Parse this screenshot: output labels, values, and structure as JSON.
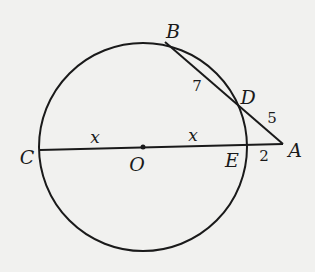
{
  "diagram": {
    "type": "geometry",
    "colors": {
      "background": "#f1f1ef",
      "stroke": "#1a1a1a"
    },
    "points": {
      "A": {
        "label": "A",
        "x": 283,
        "y": 144
      },
      "B": {
        "label": "B",
        "x": 165,
        "y": 42
      },
      "C": {
        "label": "C",
        "x": 40,
        "y": 150
      },
      "D": {
        "label": "D",
        "x": 238,
        "y": 104
      },
      "E": {
        "label": "E",
        "x": 247,
        "y": 146
      },
      "O": {
        "label": "O",
        "x": 143,
        "y": 147
      }
    },
    "circle": {
      "center": "O",
      "cx": 143,
      "cy": 147,
      "r": 104
    },
    "segments": [
      {
        "from": "C",
        "to": "A",
        "note": "diameter CE extended to A"
      },
      {
        "from": "B",
        "to": "A",
        "note": "secant through D"
      }
    ],
    "measures": {
      "BD": "7",
      "DA": "5",
      "EA": "2",
      "CO": "x",
      "OE": "x"
    }
  }
}
